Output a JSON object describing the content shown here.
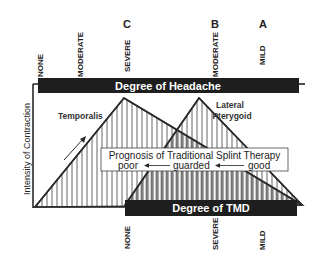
{
  "diagram": {
    "y_axis_label": "Intensity of Contraction",
    "headache_bar": {
      "label": "Degree of Headache",
      "ticks": [
        {
          "label": "NONE",
          "x": 40
        },
        {
          "label": "MODERATE",
          "x": 80
        },
        {
          "label": "SEVERE",
          "x": 127
        },
        {
          "label": "MODERATE",
          "x": 215
        },
        {
          "label": "MILD",
          "x": 262
        }
      ]
    },
    "stage_letters": [
      {
        "label": "C",
        "x": 127
      },
      {
        "label": "B",
        "x": 215
      },
      {
        "label": "A",
        "x": 263
      }
    ],
    "tmd_bar": {
      "label": "Degree of TMD",
      "ticks": [
        {
          "label": "NONE",
          "x": 127
        },
        {
          "label": "SEVERE",
          "x": 215
        },
        {
          "label": "MILD",
          "x": 262
        }
      ]
    },
    "muscles": [
      {
        "label": "Temporalis"
      },
      {
        "label_line1": "Lateral",
        "label_line2": "Pterygoid"
      }
    ],
    "prognosis": {
      "title": "Prognosis of Traditional Splint Therapy",
      "levels": [
        "poor",
        "guarded",
        "good"
      ]
    },
    "colors": {
      "bar": "#1e1e1e",
      "line": "#2a2a2a",
      "hatch": "#555555",
      "background": "#ffffff"
    }
  }
}
